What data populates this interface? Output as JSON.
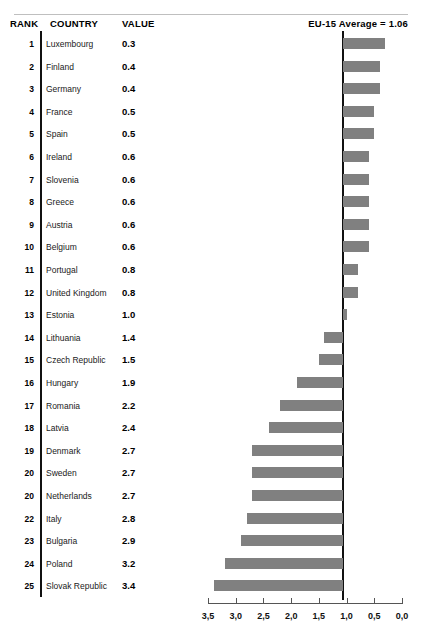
{
  "header": {
    "rank_label": "RANK",
    "country_label": "COUNTRY",
    "value_label": "VALUE",
    "average_label": "EU-15 Average = 1.06"
  },
  "style": {
    "bar_color": "#808080",
    "line_color": "#111111",
    "rule_color": "#bfbfbf",
    "axis_color": "#555555"
  },
  "chart_data": {
    "type": "bar",
    "title": "EU-15 Average = 1.06",
    "orientation": "horizontal",
    "xlabel": "",
    "ylabel": "",
    "reversed_x_axis": true,
    "xlim": [
      3.5,
      0.0
    ],
    "reference_value": 1.06,
    "reference_label": "EU-15 Average = 1.06",
    "grid": false,
    "legend": "none",
    "decimal_separator": ",",
    "tick_labels": [
      "3,5",
      "3,0",
      "2,5",
      "2,0",
      "1,5",
      "1,0",
      "0,5",
      "0,0"
    ],
    "tick_values": [
      3.5,
      3.0,
      2.5,
      2.0,
      1.5,
      1.0,
      0.5,
      0.0
    ],
    "columns": [
      "RANK",
      "COUNTRY",
      "VALUE"
    ],
    "categories": [
      "Luxembourg",
      "Finland",
      "Germany",
      "France",
      "Spain",
      "Ireland",
      "Slovenia",
      "Greece",
      "Austria",
      "Belgium",
      "Portugal",
      "United Kingdom",
      "Estonia",
      "Lithuania",
      "Czech Republic",
      "Hungary",
      "Romania",
      "Latvia",
      "Denmark",
      "Sweden",
      "Netherlands",
      "Italy",
      "Bulgaria",
      "Poland",
      "Slovak Republic"
    ],
    "values": [
      0.3,
      0.4,
      0.4,
      0.5,
      0.5,
      0.6,
      0.6,
      0.6,
      0.6,
      0.6,
      0.8,
      0.8,
      1.0,
      1.4,
      1.5,
      1.9,
      2.2,
      2.4,
      2.7,
      2.7,
      2.7,
      2.8,
      2.9,
      3.2,
      3.4
    ],
    "ranks": [
      "1",
      "2",
      "3",
      "4",
      "5",
      "6",
      "7",
      "8",
      "9",
      "10",
      "11",
      "12",
      "13",
      "14",
      "15",
      "16",
      "17",
      "18",
      "19",
      "20",
      "20",
      "22",
      "23",
      "24",
      "25"
    ]
  },
  "rows": [
    {
      "rank": "1",
      "country": "Luxembourg",
      "value": "0.3",
      "num": 0.3
    },
    {
      "rank": "2",
      "country": "Finland",
      "value": "0.4",
      "num": 0.4
    },
    {
      "rank": "3",
      "country": "Germany",
      "value": "0.4",
      "num": 0.4
    },
    {
      "rank": "4",
      "country": "France",
      "value": "0.5",
      "num": 0.5
    },
    {
      "rank": "5",
      "country": "Spain",
      "value": "0.5",
      "num": 0.5
    },
    {
      "rank": "6",
      "country": "Ireland",
      "value": "0.6",
      "num": 0.6
    },
    {
      "rank": "7",
      "country": "Slovenia",
      "value": "0.6",
      "num": 0.6
    },
    {
      "rank": "8",
      "country": "Greece",
      "value": "0.6",
      "num": 0.6
    },
    {
      "rank": "9",
      "country": "Austria",
      "value": "0.6",
      "num": 0.6
    },
    {
      "rank": "10",
      "country": "Belgium",
      "value": "0.6",
      "num": 0.6
    },
    {
      "rank": "11",
      "country": "Portugal",
      "value": "0.8",
      "num": 0.8
    },
    {
      "rank": "12",
      "country": "United Kingdom",
      "value": "0.8",
      "num": 0.8
    },
    {
      "rank": "13",
      "country": "Estonia",
      "value": "1.0",
      "num": 1.0
    },
    {
      "rank": "14",
      "country": "Lithuania",
      "value": "1.4",
      "num": 1.4
    },
    {
      "rank": "15",
      "country": "Czech Republic",
      "value": "1.5",
      "num": 1.5
    },
    {
      "rank": "16",
      "country": "Hungary",
      "value": "1.9",
      "num": 1.9
    },
    {
      "rank": "17",
      "country": "Romania",
      "value": "2.2",
      "num": 2.2
    },
    {
      "rank": "18",
      "country": "Latvia",
      "value": "2.4",
      "num": 2.4
    },
    {
      "rank": "19",
      "country": "Denmark",
      "value": "2.7",
      "num": 2.7
    },
    {
      "rank": "20",
      "country": "Sweden",
      "value": "2.7",
      "num": 2.7
    },
    {
      "rank": "20",
      "country": "Netherlands",
      "value": "2.7",
      "num": 2.7
    },
    {
      "rank": "22",
      "country": "Italy",
      "value": "2.8",
      "num": 2.8
    },
    {
      "rank": "23",
      "country": "Bulgaria",
      "value": "2.9",
      "num": 2.9
    },
    {
      "rank": "24",
      "country": "Poland",
      "value": "3.2",
      "num": 3.2
    },
    {
      "rank": "25",
      "country": "Slovak Republic",
      "value": "3.4",
      "num": 3.4
    }
  ],
  "axis": {
    "ticks": [
      {
        "label": "3,5",
        "value": 3.5
      },
      {
        "label": "3,0",
        "value": 3.0
      },
      {
        "label": "2,5",
        "value": 2.5
      },
      {
        "label": "2,0",
        "value": 2.0
      },
      {
        "label": "1,5",
        "value": 1.5
      },
      {
        "label": "1,0",
        "value": 1.0
      },
      {
        "label": "0,5",
        "value": 0.5
      },
      {
        "label": "0,0",
        "value": 0.0
      }
    ]
  }
}
